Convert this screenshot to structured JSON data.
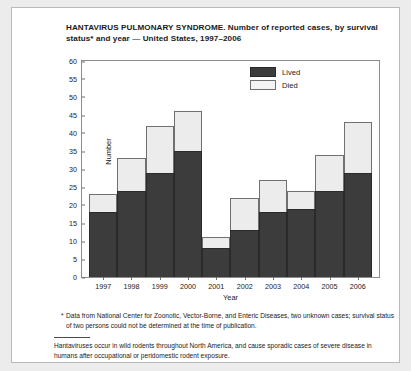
{
  "figure": {
    "title": "HANTAVIRUS PULMONARY SYNDROME. Number of reported cases, by survival status* and year — United States, 1997–2006",
    "footnote_marker": "*",
    "footnote": "Data from National Center for Zoonotic, Vector-Borne, and Enteric Diseases, two unknown cases; survival status of two persons could not be determined at the time of publication.",
    "note": "Hantaviruses occur in wild rodents throughout North America, and cause sporadic cases of severe disease in humans after occupational or peridomestic rodent exposure."
  },
  "chart_data": {
    "type": "bar",
    "stacked": true,
    "title": "HANTAVIRUS PULMONARY SYNDROME. Number of reported cases, by survival status* and year — United States, 1997–2006",
    "xlabel": "Year",
    "ylabel": "Number",
    "categories": [
      "1997",
      "1998",
      "1999",
      "2000",
      "2001",
      "2002",
      "2003",
      "2004",
      "2005",
      "2006"
    ],
    "series": [
      {
        "name": "Lived",
        "color": "#3c3c3c",
        "values": [
          18,
          24,
          29,
          35,
          8,
          13,
          18,
          19,
          24,
          29
        ]
      },
      {
        "name": "Died",
        "color": "#ececec",
        "values": [
          5,
          9,
          13,
          11,
          3,
          9,
          9,
          5,
          10,
          14
        ]
      }
    ],
    "totals": [
      23,
      33,
      42,
      46,
      11,
      22,
      27,
      24,
      34,
      43
    ],
    "ylim": [
      0,
      60
    ],
    "ytick_step": 5,
    "yticks": [
      0,
      5,
      10,
      15,
      20,
      25,
      30,
      35,
      40,
      45,
      50,
      55,
      60
    ],
    "grid": false,
    "legend_position": "top-right"
  },
  "legend": {
    "items": [
      {
        "label": "Lived"
      },
      {
        "label": "Died"
      }
    ]
  }
}
